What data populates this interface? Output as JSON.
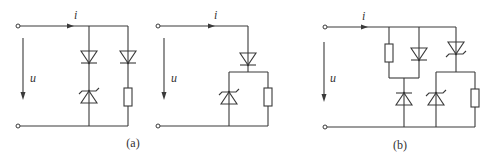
{
  "diagram": {
    "type": "circuit-schematic",
    "panels": [
      {
        "id": "a-left",
        "current_label": "i",
        "voltage_label": "u",
        "components": [
          "diode",
          "zener-diode",
          "diode",
          "resistor"
        ]
      },
      {
        "id": "a-right",
        "current_label": "i",
        "voltage_label": "u",
        "components": [
          "diode",
          "zener-diode",
          "resistor"
        ]
      },
      {
        "id": "b",
        "current_label": "i",
        "voltage_label": "u",
        "components": [
          "resistor",
          "diode",
          "zener-diode",
          "zener-diode",
          "zener-diode",
          "resistor"
        ]
      }
    ],
    "captions": {
      "a": "(a)",
      "b": "(b)"
    },
    "colors": {
      "line": "#3a3a3a",
      "background": "#ffffff"
    }
  }
}
